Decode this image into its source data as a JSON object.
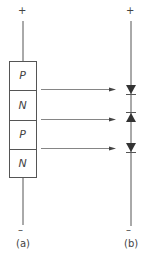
{
  "diagram": {
    "panel_a": {
      "caption": "(a)",
      "top_terminal": "+",
      "bottom_terminal": "–",
      "layers": [
        {
          "label": "P"
        },
        {
          "label": "N"
        },
        {
          "label": "P"
        },
        {
          "label": "N"
        }
      ]
    },
    "panel_b": {
      "caption": "(b)",
      "top_terminal": "+",
      "bottom_terminal": "–",
      "diodes": [
        {
          "direction": "down"
        },
        {
          "direction": "up"
        },
        {
          "direction": "down"
        }
      ]
    },
    "arrows": [
      {
        "from_junction": "P-N",
        "to_diode": 1
      },
      {
        "from_junction": "N-P",
        "to_diode": 2
      },
      {
        "from_junction": "P-N",
        "to_diode": 3
      }
    ],
    "colors": {
      "line": "#555555",
      "fill": "#333333"
    }
  }
}
